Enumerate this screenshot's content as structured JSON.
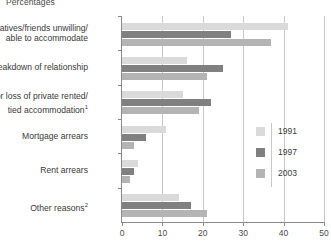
{
  "units_label": "Percentages",
  "legend": {
    "position": "right-middle",
    "entries": [
      {
        "label": "1991",
        "color": "#dadada"
      },
      {
        "label": "1997",
        "color": "#808080"
      },
      {
        "label": "2003",
        "color": "#b4b4b4"
      }
    ]
  },
  "axis": {
    "ticks": [
      "0",
      "10",
      "20",
      "30",
      "40",
      "50"
    ],
    "min": 0,
    "max": 50,
    "step": 10
  },
  "categories": [
    {
      "line1": "Relatives/friends unwilling/",
      "line2": "able to accommodate",
      "footnote": ""
    },
    {
      "line1": "Breakdown of relationship",
      "line2": "",
      "footnote": ""
    },
    {
      "line1": "End or loss of private rented/",
      "line2": "tied accommodation",
      "footnote": "1"
    },
    {
      "line1": "Mortgage arrears",
      "line2": "",
      "footnote": ""
    },
    {
      "line1": "Rent arrears",
      "line2": "",
      "footnote": ""
    },
    {
      "line1": "Other reasons",
      "line2": "",
      "footnote": "2"
    }
  ],
  "chart_data": {
    "type": "bar",
    "orientation": "horizontal",
    "title": "",
    "subtitle": "",
    "xlabel": "Percentages",
    "ylabel": "",
    "xlim": [
      0,
      50
    ],
    "grid": true,
    "legend_position": "right",
    "categories": [
      "Relatives/friends unwilling/able to accommodate",
      "Breakdown of relationship",
      "End or loss of private rented/tied accommodation",
      "Mortgage arrears",
      "Rent arrears",
      "Other reasons"
    ],
    "series": [
      {
        "name": "1991",
        "color": "#dadada",
        "values": [
          41,
          16,
          15,
          11,
          4,
          14
        ]
      },
      {
        "name": "1997",
        "color": "#808080",
        "values": [
          27,
          25,
          22,
          6,
          3,
          17
        ]
      },
      {
        "name": "2003",
        "color": "#b4b4b4",
        "values": [
          37,
          21,
          19,
          3,
          2,
          21
        ]
      }
    ]
  }
}
